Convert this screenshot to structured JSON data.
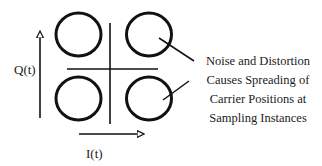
{
  "diagram": {
    "type": "constellation-diagram",
    "axes": {
      "vertical_label": "Q(t)",
      "horizontal_label": "I(t)"
    },
    "constellation_points": [
      {
        "quadrant": "top-left",
        "shape": "circle"
      },
      {
        "quadrant": "top-right",
        "shape": "circle"
      },
      {
        "quadrant": "bottom-left",
        "shape": "circle"
      },
      {
        "quadrant": "bottom-right",
        "shape": "circle"
      }
    ],
    "annotation": {
      "lines": [
        "Noise and Distortion",
        "Causes Spreading of",
        "Carrier Positions at",
        "Sampling Instances"
      ]
    },
    "colors": {
      "stroke": "#111111",
      "text": "#222222",
      "background": "#ffffff"
    }
  }
}
